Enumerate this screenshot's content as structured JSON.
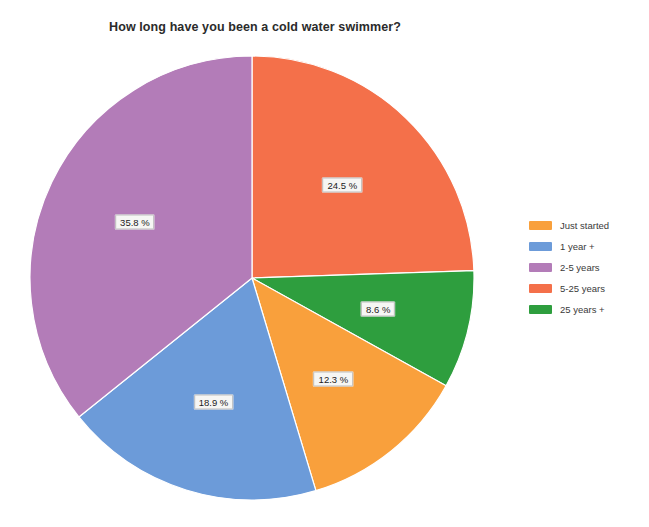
{
  "chart_data": {
    "type": "pie",
    "title": "How long have you been a cold water swimmer?",
    "xlabel": "",
    "ylabel": "",
    "legend_position": "right",
    "grid": false,
    "categories": [
      "Just started",
      "1 year +",
      "2-5 years",
      "5-25 years",
      "25 years +"
    ],
    "values": [
      12.3,
      18.9,
      35.8,
      24.5,
      8.6
    ],
    "value_unit": "%",
    "colors": [
      "#f9a03c",
      "#6c9bd9",
      "#b37cb8",
      "#f4704a",
      "#2e9e3e"
    ],
    "slice_order_clockwise_from_top": [
      {
        "label": "5-25 years",
        "value": 24.5,
        "display": "24.5 %",
        "color": "#f4704a"
      },
      {
        "label": "25 years +",
        "value": 8.6,
        "display": "8.6 %",
        "color": "#2e9e3e"
      },
      {
        "label": "Just started",
        "value": 12.3,
        "display": "12.3 %",
        "color": "#f9a03c"
      },
      {
        "label": "1 year +",
        "value": 18.9,
        "display": "18.9 %",
        "color": "#6c9bd9"
      },
      {
        "label": "2-5 years",
        "value": 35.8,
        "display": "35.8 %",
        "color": "#b37cb8"
      }
    ],
    "data_labels": [
      "24.5 %",
      "8.6 %",
      "12.3 %",
      "18.9 %",
      "35.8 %"
    ]
  },
  "chart": {
    "title": "How long have you been a cold water swimmer?"
  },
  "legend": {
    "items": [
      {
        "label": "Just started",
        "color": "#f9a03c"
      },
      {
        "label": "1 year +",
        "color": "#6c9bd9"
      },
      {
        "label": "2-5 years",
        "color": "#b37cb8"
      },
      {
        "label": "5-25 years",
        "color": "#f4704a"
      },
      {
        "label": "25 years +",
        "color": "#2e9e3e"
      }
    ]
  }
}
